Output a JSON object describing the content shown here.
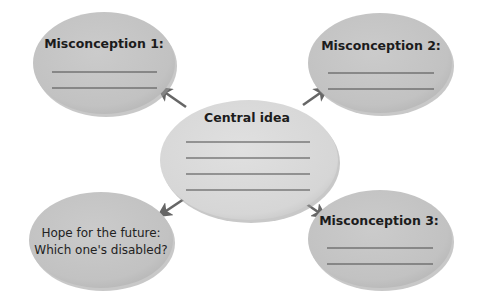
{
  "diagram": {
    "type": "concept-web",
    "colors": {
      "outer_fill": "#c4c4c4",
      "center_fill": "#dadada",
      "shadow": "#9a9a9a",
      "arrow": "#666666",
      "line": "#4a4a4a",
      "text": "#1c1c1c"
    },
    "center": {
      "title": "Central idea",
      "blank_lines": 4
    },
    "nodes": [
      {
        "id": "misconception-1",
        "title": "Misconception 1:",
        "blank_lines": 2,
        "position": "top-left"
      },
      {
        "id": "misconception-2",
        "title": "Misconception 2:",
        "blank_lines": 2,
        "position": "top-right"
      },
      {
        "id": "hope-for-future",
        "lines": [
          "Hope for the future:",
          "Which one's disabled?"
        ],
        "blank_lines": 0,
        "position": "bottom-left"
      },
      {
        "id": "misconception-3",
        "title": "Misconception 3:",
        "blank_lines": 2,
        "position": "bottom-right"
      }
    ],
    "arrows": [
      {
        "from": "center",
        "to": "misconception-1"
      },
      {
        "from": "center",
        "to": "misconception-2"
      },
      {
        "from": "center",
        "to": "hope-for-future"
      },
      {
        "from": "center",
        "to": "misconception-3"
      }
    ]
  }
}
